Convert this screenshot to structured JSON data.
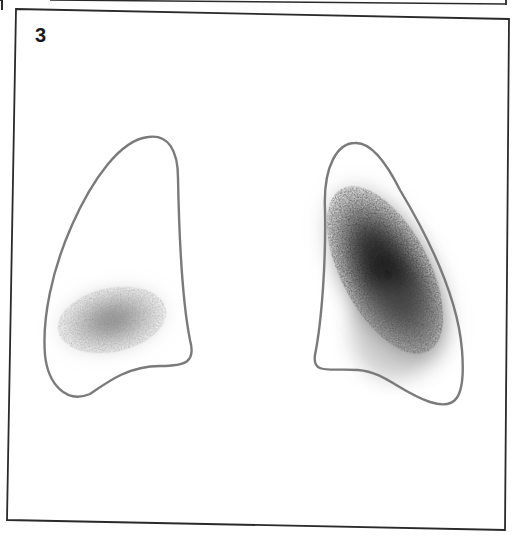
{
  "figure": {
    "panel_label": "3",
    "colors": {
      "frame": "#2a2a2a",
      "outline": "#7a7a7a",
      "uptake": "#1e1e1e",
      "background": "#ffffff"
    },
    "lungs": [
      {
        "side": "left-in-image",
        "uptake": "low",
        "uptake_location": "lower-lateral"
      },
      {
        "side": "right-in-image",
        "uptake": "high",
        "uptake_location": "diffuse-central"
      }
    ]
  }
}
